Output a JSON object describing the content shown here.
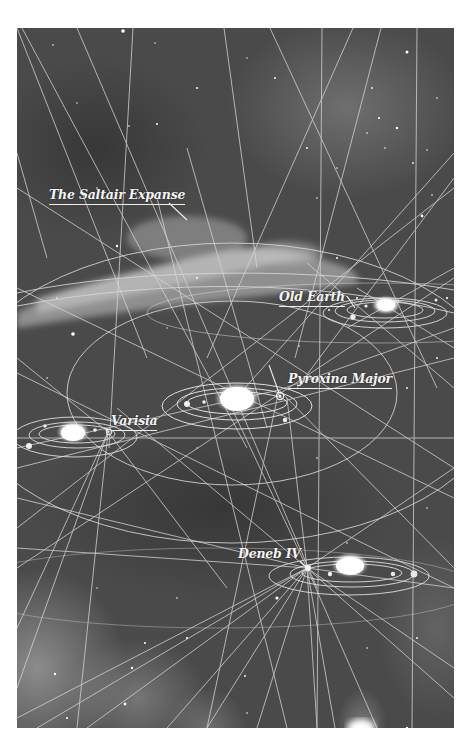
{
  "map": {
    "labels": {
      "saltair": "The Saltair Expanse",
      "old_earth": "Old Earth",
      "pyroxina": "Pyroxina Major",
      "varisia": "Varisia",
      "deneb": "Deneb IV"
    },
    "colors": {
      "background": "#4a4a4a",
      "lines": "#d8d8d8",
      "stars": "#ffffff",
      "nebula": "#bdbdbd"
    }
  }
}
